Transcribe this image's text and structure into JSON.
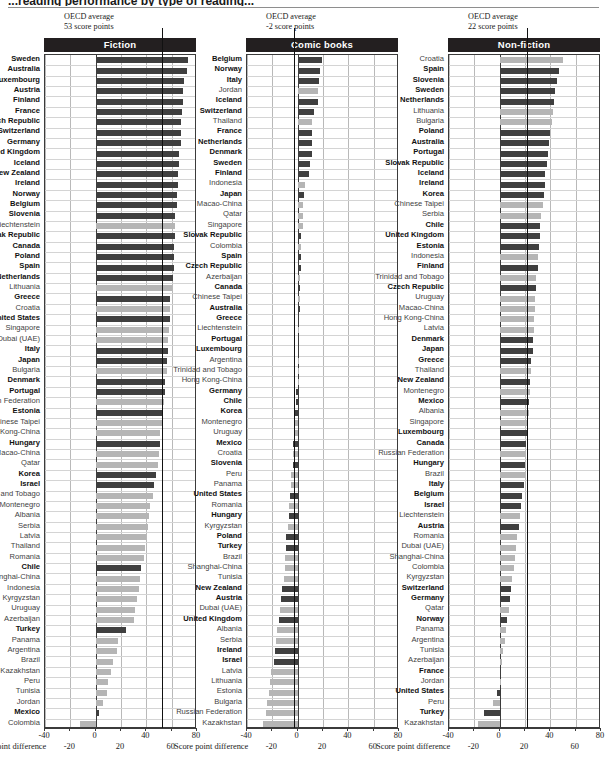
{
  "figure": {
    "cropped_title": "...reading performance by type of reading...",
    "axis_title": "Score point difference",
    "axis": {
      "min": -40,
      "max": 80,
      "ticks_upper": [
        -40,
        0,
        40,
        80
      ],
      "ticks_lower": [
        -20,
        20,
        60
      ]
    },
    "colors": {
      "bar_oecd": "#3f3f3f",
      "bar_partner": "#b5b5b5",
      "header_band": "#231f20",
      "average_line": "#111111",
      "grid": "#b9b9b9"
    }
  },
  "chart_data": [
    {
      "type": "bar",
      "title": "Fiction",
      "orientation": "horizontal",
      "xlabel": "Score point difference",
      "ylabel": "",
      "xlim": [
        -40,
        80
      ],
      "grid": true,
      "annotation": {
        "line1": "OECD average",
        "line2": "53 score points",
        "value": 53
      },
      "categories": [
        "Sweden",
        "Australia",
        "Luxembourg",
        "Austria",
        "Finland",
        "France",
        "Czech Republic",
        "Switzerland",
        "Germany",
        "United Kingdom",
        "Iceland",
        "New Zealand",
        "Ireland",
        "Norway",
        "Belgium",
        "Slovenia",
        "Liechtenstein",
        "Slovak Republic",
        "Canada",
        "Poland",
        "Spain",
        "Netherlands",
        "Lithuania",
        "Greece",
        "Croatia",
        "United States",
        "Singapore",
        "Dubai (UAE)",
        "Italy",
        "Japan",
        "Bulgaria",
        "Denmark",
        "Portugal",
        "Russian Federation",
        "Estonia",
        "Chinese Taipei",
        "Hong Kong-China",
        "Hungary",
        "Macao-China",
        "Qatar",
        "Korea",
        "Israel",
        "Trinidad and Tobago",
        "Montenegro",
        "Albania",
        "Serbia",
        "Latvia",
        "Thailand",
        "Romania",
        "Chile",
        "Shanghai-China",
        "Indonesia",
        "Kyrgyzstan",
        "Uruguay",
        "Azerbaijan",
        "Turkey",
        "Panama",
        "Argentina",
        "Brazil",
        "Kazakhstan",
        "Peru",
        "Tunisia",
        "Jordan",
        "Mexico",
        "Colombia"
      ],
      "values": [
        73,
        72,
        70,
        69,
        69,
        68,
        67,
        67,
        67,
        66,
        66,
        65,
        65,
        64,
        64,
        63,
        63,
        63,
        62,
        62,
        62,
        61,
        60,
        59,
        59,
        59,
        58,
        57,
        57,
        56,
        56,
        55,
        55,
        54,
        53,
        52,
        51,
        51,
        50,
        49,
        48,
        46,
        45,
        43,
        42,
        41,
        40,
        39,
        38,
        36,
        35,
        34,
        33,
        31,
        30,
        24,
        18,
        17,
        14,
        12,
        10,
        9,
        6,
        3,
        -12
      ],
      "partner_flags": [
        false,
        false,
        false,
        false,
        false,
        false,
        false,
        false,
        false,
        false,
        false,
        false,
        false,
        false,
        false,
        false,
        true,
        false,
        false,
        false,
        false,
        false,
        true,
        false,
        true,
        false,
        true,
        true,
        false,
        false,
        true,
        false,
        false,
        true,
        false,
        true,
        true,
        false,
        true,
        true,
        false,
        false,
        true,
        true,
        true,
        true,
        true,
        true,
        true,
        false,
        true,
        true,
        true,
        true,
        true,
        false,
        true,
        true,
        true,
        true,
        true,
        true,
        true,
        false,
        true
      ]
    },
    {
      "type": "bar",
      "title": "Comic books",
      "orientation": "horizontal",
      "xlabel": "Score point difference",
      "ylabel": "",
      "xlim": [
        -40,
        80
      ],
      "grid": true,
      "annotation": {
        "line1": "OECD average",
        "line2": "-2 score points",
        "value": -2
      },
      "categories": [
        "Belgium",
        "Norway",
        "Italy",
        "Jordan",
        "Iceland",
        "Switzerland",
        "Thailand",
        "France",
        "Netherlands",
        "Denmark",
        "Sweden",
        "Finland",
        "Indonesia",
        "Japan",
        "Macao-China",
        "Qatar",
        "Singapore",
        "Slovak Republic",
        "Colombia",
        "Spain",
        "Czech Republic",
        "Azerbaijan",
        "Canada",
        "Chinese Taipei",
        "Australia",
        "Greece",
        "Liechtenstein",
        "Portugal",
        "Luxembourg",
        "Argentina",
        "Trinidad and Tobago",
        "Hong Kong-China",
        "Germany",
        "Chile",
        "Korea",
        "Montenegro",
        "Uruguay",
        "Mexico",
        "Croatia",
        "Slovenia",
        "Peru",
        "Panama",
        "United States",
        "Romania",
        "Hungary",
        "Kyrgyzstan",
        "Poland",
        "Turkey",
        "Brazil",
        "Shanghai-China",
        "Tunisia",
        "New Zealand",
        "Austria",
        "Dubai (UAE)",
        "United Kingdom",
        "Albania",
        "Serbia",
        "Ireland",
        "Israel",
        "Latvia",
        "Lithuania",
        "Estonia",
        "Bulgaria",
        "Russian Federation",
        "Kazakhstan"
      ],
      "values": [
        19,
        18,
        17,
        16,
        16,
        13,
        11,
        11,
        11,
        11,
        10,
        9,
        6,
        5,
        4,
        4,
        4,
        3,
        3,
        3,
        3,
        2,
        2,
        2,
        2,
        1,
        1,
        1,
        1,
        0,
        0,
        0,
        -1,
        -1,
        -2,
        -2,
        -3,
        -4,
        -4,
        -4,
        -5,
        -5,
        -6,
        -7,
        -7,
        -8,
        -9,
        -9,
        -10,
        -10,
        -11,
        -12,
        -13,
        -14,
        -15,
        -16,
        -17,
        -18,
        -19,
        -21,
        -22,
        -23,
        -24,
        -25,
        -27
      ],
      "partner_flags": [
        false,
        false,
        false,
        true,
        false,
        false,
        true,
        false,
        false,
        false,
        false,
        false,
        true,
        false,
        true,
        true,
        true,
        false,
        true,
        false,
        false,
        true,
        false,
        true,
        false,
        false,
        true,
        false,
        false,
        true,
        true,
        true,
        false,
        false,
        false,
        true,
        true,
        false,
        true,
        false,
        true,
        true,
        false,
        true,
        false,
        true,
        false,
        false,
        true,
        true,
        true,
        false,
        false,
        true,
        false,
        true,
        true,
        false,
        false,
        true,
        true,
        true,
        true,
        true,
        true
      ]
    },
    {
      "type": "bar",
      "title": "Non-fiction",
      "orientation": "horizontal",
      "xlabel": "Score point difference",
      "ylabel": "",
      "xlim": [
        -40,
        80
      ],
      "grid": true,
      "annotation": {
        "line1": "OECD average",
        "line2": "22 score points",
        "value": 22
      },
      "categories": [
        "Croatia",
        "Spain",
        "Slovenia",
        "Sweden",
        "Netherlands",
        "Lithuania",
        "Bulgaria",
        "Poland",
        "Australia",
        "Portugal",
        "Slovak Republic",
        "Iceland",
        "Ireland",
        "Korea",
        "Chinese Taipei",
        "Serbia",
        "Chile",
        "United Kingdom",
        "Estonia",
        "Indonesia",
        "Finland",
        "Trinidad and Tobago",
        "Czech Republic",
        "Uruguay",
        "Macao-China",
        "Hong Kong-China",
        "Latvia",
        "Denmark",
        "Japan",
        "Greece",
        "Thailand",
        "New Zealand",
        "Montenegro",
        "Mexico",
        "Albania",
        "Singapore",
        "Luxembourg",
        "Canada",
        "Russian Federation",
        "Hungary",
        "Brazil",
        "Italy",
        "Belgium",
        "Israel",
        "Liechtenstein",
        "Austria",
        "Romania",
        "Dubai (UAE)",
        "Shanghai-China",
        "Colombia",
        "Kyrgyzstan",
        "Switzerland",
        "Germany",
        "Qatar",
        "Norway",
        "Panama",
        "Argentina",
        "Tunisia",
        "Azerbaijan",
        "France",
        "Jordan",
        "United States",
        "Peru",
        "Turkey",
        "Kazakhstan"
      ],
      "values": [
        50,
        47,
        45,
        44,
        43,
        42,
        41,
        40,
        39,
        38,
        37,
        36,
        36,
        35,
        34,
        33,
        32,
        32,
        31,
        30,
        30,
        29,
        29,
        28,
        28,
        27,
        27,
        26,
        26,
        25,
        25,
        24,
        24,
        23,
        23,
        22,
        22,
        21,
        21,
        20,
        20,
        19,
        18,
        17,
        16,
        15,
        14,
        13,
        12,
        11,
        10,
        9,
        8,
        7,
        6,
        5,
        4,
        3,
        2,
        1,
        0,
        -2,
        -5,
        -12,
        -17
      ],
      "partner_flags": [
        true,
        false,
        false,
        false,
        false,
        true,
        true,
        false,
        false,
        false,
        false,
        false,
        false,
        false,
        true,
        true,
        false,
        false,
        false,
        true,
        false,
        true,
        false,
        true,
        true,
        true,
        true,
        false,
        false,
        false,
        true,
        false,
        true,
        false,
        true,
        true,
        false,
        false,
        true,
        false,
        true,
        false,
        false,
        false,
        true,
        false,
        true,
        true,
        true,
        true,
        true,
        false,
        false,
        true,
        false,
        true,
        true,
        true,
        true,
        false,
        true,
        false,
        true,
        false,
        true
      ]
    }
  ]
}
